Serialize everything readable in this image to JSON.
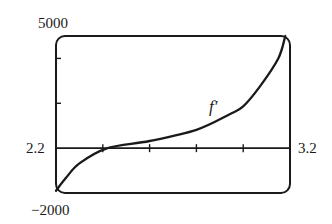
{
  "chart_data": {
    "type": "line",
    "title": "",
    "xlabel": "",
    "ylabel": "",
    "xlim": [
      2.2,
      3.2
    ],
    "ylim": [
      -2000,
      5000
    ],
    "x_tick_labels": [
      "2.2",
      "3.2"
    ],
    "y_tick_labels": [
      "5000",
      "-2000"
    ],
    "x_ticks": [
      2.4,
      2.6,
      2.8,
      3.0
    ],
    "y_ticks": [
      2000,
      4000
    ],
    "grid": false,
    "legend": null,
    "annotations": [
      {
        "text": "f′",
        "x": 2.87,
        "y": 1700
      }
    ],
    "series": [
      {
        "name": "f′",
        "x": [
          2.2,
          2.24,
          2.3,
          2.42,
          2.6,
          2.8,
          2.94,
          3.0,
          3.07,
          3.15,
          3.18
        ],
        "values": [
          -1900,
          -1360,
          -680,
          0,
          320,
          820,
          1500,
          1860,
          2730,
          4000,
          5000
        ]
      }
    ]
  },
  "labels": {
    "y_max": "5000",
    "y_min": "−2000",
    "x_min": "2.2",
    "x_max": "3.2",
    "curve": "f′"
  }
}
